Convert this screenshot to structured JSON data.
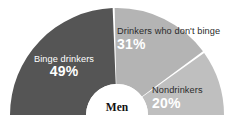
{
  "chart_data": {
    "type": "pie",
    "variant": "semicircle-donut",
    "title": "",
    "subtitle": "",
    "center_label": "Men",
    "xlabel": "",
    "ylabel": "",
    "legend_position": "in-slice",
    "grid": false,
    "total": 100,
    "unit": "%",
    "categories": [
      "Binge drinkers",
      "Drinkers who don't binge",
      "Nondrinkers"
    ],
    "values": [
      49,
      31,
      20
    ],
    "value_labels": [
      "49%",
      "31%",
      "20%"
    ],
    "slices": [
      {
        "label": "Binge drinkers",
        "value": 49,
        "value_label": "49%",
        "color": "#555555",
        "name_color": "#ffffff",
        "pct_color": "#ffffff",
        "start_angle_deg": 180,
        "end_angle_deg": 91.8
      },
      {
        "label": "Drinkers who don't binge",
        "value": 31,
        "value_label": "31%",
        "color": "#b4b4b4",
        "name_color": "#2b2b2b",
        "pct_color": "#ffffff",
        "start_angle_deg": 91.8,
        "end_angle_deg": 36.0
      },
      {
        "label": "Nondrinkers",
        "value": 20,
        "value_label": "20%",
        "color": "#bfbfbf",
        "name_color": "#2b2b2b",
        "pct_color": "#ffffff",
        "start_angle_deg": 36.0,
        "end_angle_deg": 0
      }
    ],
    "colors": {
      "background": "#ffffff",
      "hub": "#ffffff",
      "divider": "#ffffff",
      "dark_slice": "#555555",
      "mid_slice": "#b4b4b4",
      "light_slice": "#bfbfbf"
    },
    "geometry": {
      "center_x": 117,
      "center_y": 115,
      "outer_radius": 107,
      "inner_radius": 31
    }
  }
}
